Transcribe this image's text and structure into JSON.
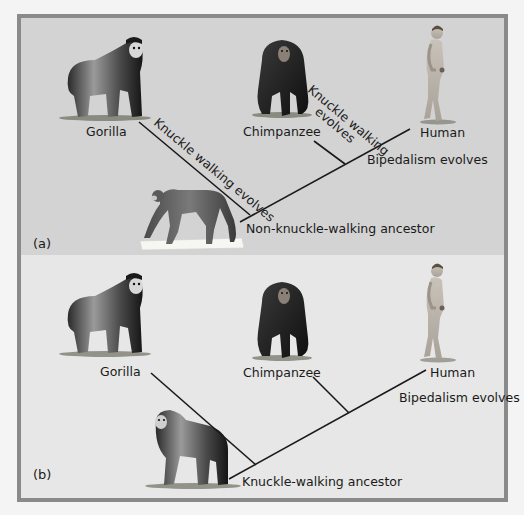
{
  "figure": {
    "panels": [
      {
        "tag": "(a)",
        "background": "#d3d3d3",
        "taxa": {
          "gorilla": "Gorilla",
          "chimpanzee": "Chimpanzee",
          "human": "Human"
        },
        "ancestor_label": "Non-knuckle-walking ancestor",
        "annotations": {
          "gorilla_branch": "Knuckle walking evolves",
          "chimp_branch_line1": "Knuckle walking",
          "chimp_branch_line2": "evolves",
          "human_branch": "Bipedalism evolves"
        },
        "ancestor_animal": "monkey-like quadruped"
      },
      {
        "tag": "(b)",
        "background": "#e7e7e7",
        "taxa": {
          "gorilla": "Gorilla",
          "chimpanzee": "Chimpanzee",
          "human": "Human"
        },
        "ancestor_label": "Knuckle-walking ancestor",
        "annotations": {
          "human_branch": "Bipedalism evolves"
        },
        "ancestor_animal": "gorilla-like knuckle-walker"
      }
    ],
    "colors": {
      "frame_border": "#8a8a8a",
      "line": "#1a1a1a",
      "text": "#1a1a1a"
    }
  }
}
